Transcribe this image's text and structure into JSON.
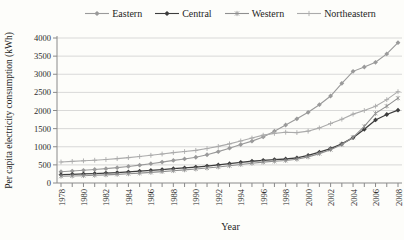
{
  "chart_data": {
    "type": "line",
    "title": "",
    "xlabel": "Year",
    "ylabel": "Per capita electricity consumption (kWh)",
    "x": [
      1978,
      1979,
      1980,
      1981,
      1982,
      1983,
      1984,
      1985,
      1986,
      1987,
      1988,
      1989,
      1990,
      1991,
      1992,
      1993,
      1994,
      1995,
      1996,
      1997,
      1998,
      1999,
      2000,
      2001,
      2002,
      2003,
      2004,
      2005,
      2006,
      2007,
      2008
    ],
    "x_tick_label_step": 2,
    "ylim": [
      0,
      4000
    ],
    "y_tick_step": 500,
    "grid": true,
    "legend_position": "top",
    "axis_color": "#8a8a8a",
    "grid_color": "#cccccc",
    "series": [
      {
        "name": "Eastern",
        "color": "#9a9a9a",
        "marker": "diamond",
        "values": [
          310,
          330,
          350,
          372,
          396,
          424,
          456,
          492,
          532,
          576,
          624,
          664,
          710,
          780,
          865,
          960,
          1060,
          1155,
          1270,
          1430,
          1600,
          1770,
          1950,
          2160,
          2400,
          2750,
          3080,
          3200,
          3330,
          3560,
          3870
        ]
      },
      {
        "name": "Central",
        "color": "#3d3d3d",
        "marker": "diamond",
        "values": [
          230,
          240,
          250,
          261,
          273,
          288,
          305,
          325,
          347,
          371,
          396,
          417,
          440,
          468,
          500,
          534,
          570,
          600,
          626,
          646,
          662,
          695,
          760,
          850,
          950,
          1080,
          1250,
          1480,
          1740,
          1890,
          2010
        ]
      },
      {
        "name": "Western",
        "color": "#8f8f8f",
        "marker": "asterisk",
        "values": [
          185,
          193,
          202,
          212,
          224,
          238,
          254,
          272,
          292,
          315,
          340,
          362,
          385,
          412,
          442,
          475,
          510,
          545,
          575,
          600,
          620,
          655,
          720,
          810,
          920,
          1060,
          1260,
          1560,
          1920,
          2120,
          2340
        ]
      },
      {
        "name": "Northeastern",
        "color": "#ababab",
        "marker": "plus",
        "values": [
          580,
          596,
          612,
          628,
          648,
          672,
          700,
          730,
          764,
          800,
          838,
          868,
          900,
          950,
          1010,
          1080,
          1160,
          1240,
          1320,
          1370,
          1400,
          1390,
          1430,
          1520,
          1640,
          1760,
          1900,
          2000,
          2120,
          2300,
          2520
        ]
      }
    ]
  }
}
